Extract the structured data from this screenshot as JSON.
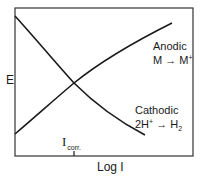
{
  "diagram": {
    "y_axis_label": "E",
    "x_axis_label": "Log I",
    "tick_label": {
      "main": "I",
      "subscript": "corr."
    },
    "anodic": {
      "title": "Anodic",
      "reaction_left": "M",
      "arrow": "→",
      "reaction_right": "M",
      "reaction_right_sup": "+"
    },
    "cathodic": {
      "title": "Cathodic",
      "reaction_left": "2H",
      "reaction_left_sup": "+",
      "arrow": "→",
      "reaction_right": "H",
      "reaction_right_sub": "2"
    },
    "colors": {
      "line": "#1a1a1a",
      "frame": "#333333",
      "background": "#ffffff"
    },
    "frame_px": {
      "left": 15,
      "top": 8,
      "right": 193,
      "bottom": 156
    },
    "curves_px": {
      "cathodic": [
        [
          15,
          16
        ],
        [
          45,
          49
        ],
        [
          74,
          83
        ],
        [
          105,
          110
        ],
        [
          125,
          123
        ],
        [
          145,
          135
        ]
      ],
      "anodic": [
        [
          15,
          134
        ],
        [
          45,
          108
        ],
        [
          74,
          83
        ],
        [
          100,
          65
        ],
        [
          120,
          51
        ],
        [
          145,
          37
        ],
        [
          172,
          23
        ]
      ],
      "intersection": [
        74,
        83
      ]
    }
  }
}
